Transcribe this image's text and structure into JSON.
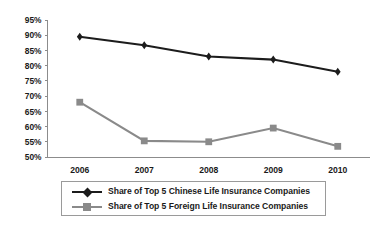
{
  "chart_data": {
    "type": "line",
    "title": "",
    "xlabel": "",
    "ylabel": "",
    "categories": [
      "2006",
      "2007",
      "2008",
      "2009",
      "2010"
    ],
    "ylim": [
      50,
      95
    ],
    "ytick_labels": [
      "50%",
      "55%",
      "60%",
      "65%",
      "70%",
      "75%",
      "80%",
      "85%",
      "90%",
      "95%"
    ],
    "ytick_values": [
      50,
      55,
      60,
      65,
      70,
      75,
      80,
      85,
      90,
      95
    ],
    "ytick_suffix": "%",
    "grid": false,
    "legend_position": "bottom",
    "series": [
      {
        "name": "Share of Top 5 Chinese Life Insurance Companies",
        "key": "chinese",
        "color": "#1c1c1c",
        "marker": "diamond",
        "values": [
          89.5,
          86.7,
          83.0,
          82.0,
          78.0
        ]
      },
      {
        "name": "Share of Top 5 Foreign Life Insurance Companies",
        "key": "foreign",
        "color": "#8a8a8a",
        "marker": "square",
        "values": [
          68.0,
          55.3,
          55.0,
          59.5,
          53.5
        ]
      }
    ]
  },
  "axis": {
    "y": {
      "ticks": [
        {
          "label": "95%"
        },
        {
          "label": "90%"
        },
        {
          "label": "85%"
        },
        {
          "label": "80%"
        },
        {
          "label": "75%"
        },
        {
          "label": "70%"
        },
        {
          "label": "65%"
        },
        {
          "label": "60%"
        },
        {
          "label": "55%"
        },
        {
          "label": "50%"
        }
      ]
    },
    "x": {
      "ticks": [
        {
          "label": "2006"
        },
        {
          "label": "2007"
        },
        {
          "label": "2008"
        },
        {
          "label": "2009"
        },
        {
          "label": "2010"
        }
      ]
    }
  },
  "legend": {
    "items": [
      {
        "label": "Share of Top 5 Chinese Life Insurance Companies"
      },
      {
        "label": "Share of Top 5 Foreign Life Insurance Companies"
      }
    ]
  },
  "colors": {
    "series_chinese": "#1c1c1c",
    "series_foreign": "#8a8a8a",
    "axis": "#8c8c8c",
    "text": "#1a1a1a",
    "background": "#ffffff"
  }
}
